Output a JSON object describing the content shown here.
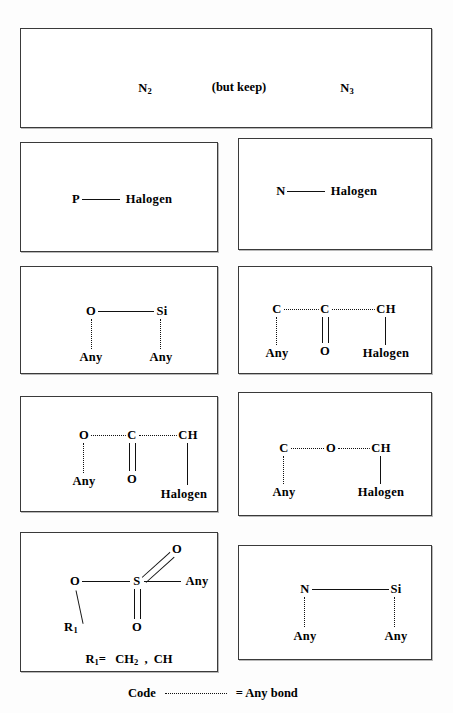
{
  "figure": {
    "panels": [
      {
        "id": "panel-azide",
        "labels": [
          "N2",
          "(but keep)",
          "N3"
        ]
      },
      {
        "id": "panel-p-halogen",
        "atoms": [
          "P",
          "Halogen"
        ],
        "bond": "single"
      },
      {
        "id": "panel-n-halogen",
        "atoms": [
          "N",
          "Halogen"
        ],
        "bond": "single"
      },
      {
        "id": "panel-o-si",
        "atoms": [
          "O",
          "Si",
          "Any",
          "Any"
        ]
      },
      {
        "id": "panel-c-c-ch",
        "atoms": [
          "C",
          "C",
          "CH",
          "Any",
          "O",
          "Halogen"
        ]
      },
      {
        "id": "panel-o-c-ch",
        "atoms": [
          "O",
          "C",
          "CH",
          "Any",
          "O",
          "Halogen"
        ]
      },
      {
        "id": "panel-c-o-ch",
        "atoms": [
          "C",
          "O",
          "CH",
          "Any",
          "Halogen"
        ]
      },
      {
        "id": "panel-sulfonate",
        "atoms": [
          "O",
          "S",
          "O",
          "O",
          "Any",
          "R1"
        ],
        "definition": {
          "symbol": "R1=",
          "group_a": "CH2",
          "separator": ",",
          "group_b": "CH"
        }
      },
      {
        "id": "panel-n-si",
        "atoms": [
          "N",
          "Si",
          "Any",
          "Any"
        ]
      }
    ],
    "text": {
      "n2": "N",
      "n2_sub": "2",
      "but_keep": "(but keep)",
      "n3": "N",
      "n3_sub": "3",
      "p": "P",
      "n": "N",
      "halogen": "Halogen",
      "o": "O",
      "si": "Si",
      "c": "C",
      "ch": "CH",
      "s": "S",
      "any": "Any",
      "r1": "R",
      "r1_sub": "1",
      "r1_eq": "R",
      "r1_eq_sub": "1",
      "r1_eq_tail": "=",
      "ch2": "CH",
      "ch2_sub": "2",
      "comma": ",",
      "ch_group": "CH"
    },
    "legend": {
      "code_label": "Code",
      "equals_any_bond": "= Any bond"
    },
    "colors": {
      "ink": "#111111",
      "border": "#3a3a3a",
      "background": "#ffffff"
    }
  }
}
